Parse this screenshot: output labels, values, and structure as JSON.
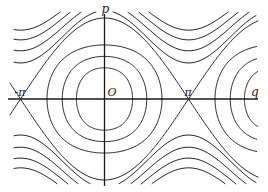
{
  "diagram": {
    "type": "phase-portrait",
    "colors": {
      "ink": "#2a2a2a",
      "background": "#ffffff"
    },
    "axes": {
      "horizontal_label": "q",
      "vertical_label": "p",
      "origin_label": "O",
      "tick_labels": [
        {
          "label": "-π",
          "q": -3.14159
        },
        {
          "label": "π",
          "q": 3.14159
        }
      ],
      "q_range": [
        -3.6,
        6.3
      ],
      "p_range": [
        -2.1,
        2.1
      ]
    },
    "closed_orbits_center_0": [
      {
        "q_amp": 1.05,
        "p_amp": 0.82
      },
      {
        "q_amp": 1.58,
        "p_amp": 1.12
      },
      {
        "q_amp": 2.15,
        "p_amp": 1.42
      }
    ],
    "closed_orbits_center_2pi": [
      {
        "q_amp": 1.05,
        "p_amp": 0.82
      },
      {
        "q_amp": 1.58,
        "p_amp": 1.12
      },
      {
        "q_amp": 2.15,
        "p_amp": 1.42
      }
    ],
    "separatrix": {
      "p_max": 2.0
    },
    "rotating_orbits": [
      {
        "p_at_0": 2.18,
        "p_at_pi": 0.89
      },
      {
        "p_at_0": 2.35,
        "p_at_pi": 1.19
      },
      {
        "p_at_0": 2.52,
        "p_at_pi": 1.46
      },
      {
        "p_at_0": 2.68,
        "p_at_pi": 1.7
      }
    ]
  }
}
